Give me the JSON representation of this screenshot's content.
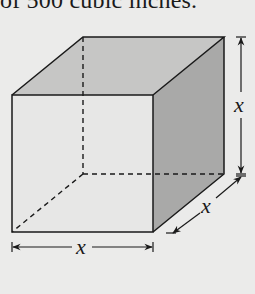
{
  "caption": {
    "text": "of 500 cubic inches."
  },
  "diagram": {
    "type": "cube",
    "labels": {
      "height": "x",
      "depth": "x",
      "width": "x"
    },
    "colors": {
      "background": "#ebebea",
      "front_face": "#e7e7e6",
      "top_face": "#c6c6c5",
      "right_face": "#a9a9a8",
      "edges": "#1a1a1a"
    }
  }
}
